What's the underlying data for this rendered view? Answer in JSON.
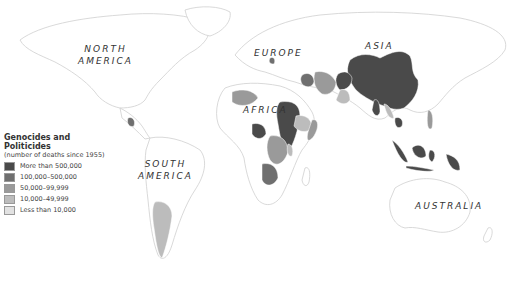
{
  "map": {
    "region_labels": [
      {
        "id": "north-america",
        "text": "NORTH\nAMERICA",
        "x": 78,
        "y": 43
      },
      {
        "id": "europe",
        "text": "EUROPE",
        "x": 254,
        "y": 47
      },
      {
        "id": "asia",
        "text": "ASIA",
        "x": 365,
        "y": 40
      },
      {
        "id": "africa",
        "text": "AFRICA",
        "x": 243,
        "y": 104
      },
      {
        "id": "south-america",
        "text": "SOUTH\nAMERICA",
        "x": 138,
        "y": 158
      },
      {
        "id": "australia",
        "text": "AUSTRALIA",
        "x": 415,
        "y": 200
      }
    ]
  },
  "legend": {
    "title": "Genocides and Politicides",
    "subtitle": "(number of deaths since 1955)",
    "items": [
      {
        "label": "More than 500,000",
        "color": "#4a4a4a"
      },
      {
        "label": "100,000–500,000",
        "color": "#6f6f6f"
      },
      {
        "label": "50,000–99,999",
        "color": "#9a9a9a"
      },
      {
        "label": "10,000–49,999",
        "color": "#bcbcbc"
      },
      {
        "label": "Less than 10,000",
        "color": "#e2e2e2"
      }
    ]
  }
}
